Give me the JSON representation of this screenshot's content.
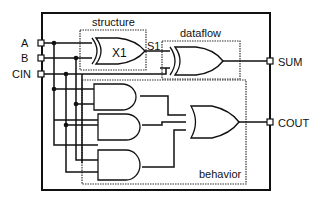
{
  "diagram": {
    "inputs": [
      {
        "label": "A"
      },
      {
        "label": "B"
      },
      {
        "label": "CIN"
      }
    ],
    "outputs": [
      {
        "label": "SUM"
      },
      {
        "label": "COUT"
      }
    ],
    "regions": {
      "structure": "structure",
      "dataflow": "dataflow",
      "behavior": "behavior"
    },
    "gates": {
      "x1_label": "X1",
      "signal_s1": "S1"
    },
    "colors": {
      "stroke": "#111111",
      "background": "#ffffff",
      "dotted": "#333333"
    }
  }
}
